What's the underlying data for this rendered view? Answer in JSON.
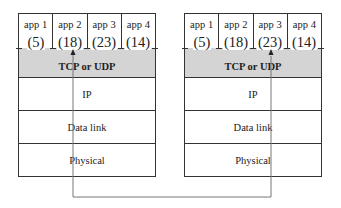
{
  "hosts": [
    {
      "side": "left",
      "apps": [
        {
          "label": "app 1",
          "port": "(5)"
        },
        {
          "label": "app 2",
          "port": "(18)"
        },
        {
          "label": "app 3",
          "port": "(23)"
        },
        {
          "label": "app 4",
          "port": "(14)"
        }
      ],
      "transport": "TCP or UDP",
      "layers": [
        "IP",
        "Data link",
        "Physical"
      ]
    },
    {
      "side": "right",
      "apps": [
        {
          "label": "app 1",
          "port": "(5)"
        },
        {
          "label": "app 2",
          "port": "(18)"
        },
        {
          "label": "app 3",
          "port": "(23)"
        },
        {
          "label": "app 4",
          "port": "(14)"
        }
      ],
      "transport": "TCP or UDP",
      "layers": [
        "IP",
        "Data link",
        "Physical"
      ]
    }
  ],
  "connection": {
    "from": "left host app 2 port (18)",
    "to": "right host app 3 port (23)"
  },
  "colors": {
    "transport_band": "#d4d4d4",
    "lines": "#333333",
    "route_line": "#777777"
  }
}
